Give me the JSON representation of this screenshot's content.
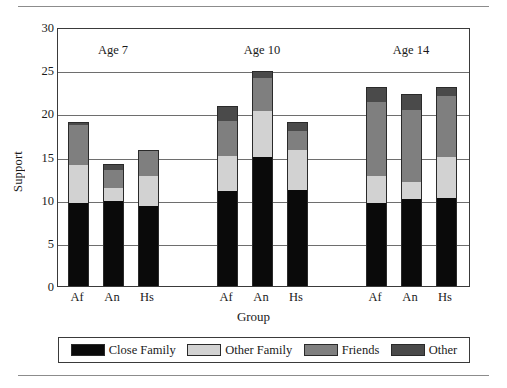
{
  "chart_data": {
    "type": "bar",
    "subtype": "stacked",
    "title": "",
    "xlabel": "Group",
    "ylabel": "Support",
    "ylim": [
      0,
      30
    ],
    "yticks": [
      0,
      5,
      10,
      15,
      20,
      25,
      30
    ],
    "grid": true,
    "legend_position": "bottom",
    "group_panels": [
      "Age 7",
      "Age 10",
      "Age 14"
    ],
    "categories": [
      "Af",
      "An",
      "Hs",
      "Af",
      "An",
      "Hs",
      "Af",
      "An",
      "Hs"
    ],
    "series": [
      {
        "name": "Close Family",
        "color": "#0a0a0a",
        "values": [
          9.6,
          9.9,
          9.3,
          11.0,
          14.9,
          11.1,
          9.6,
          10.1,
          10.2
        ]
      },
      {
        "name": "Other Family",
        "color": "#d2d2d2",
        "values": [
          4.4,
          1.4,
          3.4,
          4.1,
          5.4,
          4.7,
          3.2,
          1.9,
          4.8
        ]
      },
      {
        "name": "Friends",
        "color": "#7f7f7f",
        "values": [
          4.6,
          2.1,
          2.9,
          4.0,
          3.8,
          2.2,
          8.5,
          8.4,
          7.0
        ]
      },
      {
        "name": "Other",
        "color": "#4a4a4a",
        "values": [
          0.4,
          0.7,
          0.1,
          1.7,
          0.8,
          1.0,
          1.8,
          1.8,
          1.1
        ]
      }
    ],
    "totals": [
      19.0,
      14.1,
      15.7,
      20.8,
      24.9,
      19.0,
      23.1,
      22.2,
      23.1
    ]
  },
  "axes": {
    "y_title": "Support",
    "x_title": "Group",
    "y_tick_labels": [
      "30",
      "25",
      "20",
      "15",
      "10",
      "5",
      "0"
    ],
    "x_tick_labels": [
      "Af",
      "An",
      "Hs",
      "Af",
      "An",
      "Hs",
      "Af",
      "An",
      "Hs"
    ]
  },
  "panels": [
    {
      "label": "Age 7"
    },
    {
      "label": "Age 10"
    },
    {
      "label": "Age 14"
    }
  ],
  "legend": {
    "items": [
      {
        "label": "Close Family",
        "color": "#0a0a0a"
      },
      {
        "label": "Other Family",
        "color": "#d2d2d2"
      },
      {
        "label": "Friends",
        "color": "#7f7f7f"
      },
      {
        "label": "Other",
        "color": "#4a4a4a"
      }
    ]
  }
}
